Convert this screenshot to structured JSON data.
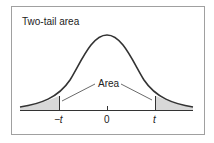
{
  "title": "Two-tail area",
  "area_label": "Area",
  "x_ticks": {
    "neg": "−t",
    "zero": "0",
    "pos": "t"
  },
  "colors": {
    "curve": "#333333",
    "shade": "#d8d8d8",
    "border": "#999999"
  }
}
